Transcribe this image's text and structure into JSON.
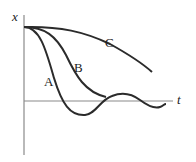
{
  "diagram": {
    "type": "damped-oscillation-curves",
    "axes": {
      "y_label": "x",
      "x_label": "t"
    },
    "curves": [
      {
        "id": "A",
        "label": "A",
        "description": "underdamped"
      },
      {
        "id": "B",
        "label": "B",
        "description": "critically damped"
      },
      {
        "id": "C",
        "label": "C",
        "description": "overdamped"
      }
    ],
    "colors": {
      "curve": "#2b2b2b",
      "axis": "#8a8a8a",
      "text": "#222222"
    }
  }
}
